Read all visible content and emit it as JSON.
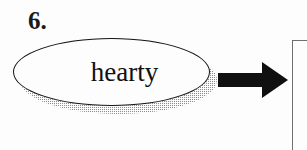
{
  "page": {
    "background_color": "#fdfdfd",
    "ink_color": "#141414"
  },
  "exercise": {
    "number_label": "6.",
    "oval": {
      "word": "hearty",
      "shape": "ellipse",
      "outline_color": "#141414",
      "fill_color": "#fdfdfd",
      "shadow_style": "halftone-dither",
      "shadow_color": "#8d8d8d"
    },
    "arrow": {
      "direction": "right",
      "color": "#101010"
    },
    "answer_box": {
      "border_color": "#6f6f6f",
      "fill_color": "#fdfdfd",
      "content": ""
    }
  }
}
